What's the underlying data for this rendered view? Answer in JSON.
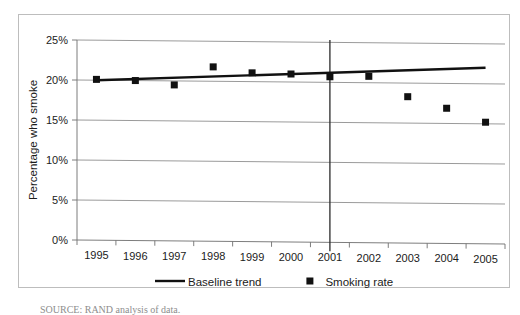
{
  "figure": {
    "source_note": "SOURCE: RAND analysis of data."
  },
  "chart_data": {
    "type": "scatter",
    "title": "",
    "subtitle": "",
    "xlabel": "",
    "ylabel": "Percentage who smoke",
    "categories": [
      "1995",
      "1996",
      "1997",
      "1998",
      "1999",
      "2000",
      "2001",
      "2002",
      "2003",
      "2004",
      "2005"
    ],
    "ylim": [
      0,
      25
    ],
    "ytick_labels": [
      "0%",
      "5%",
      "10%",
      "15%",
      "20%",
      "25%"
    ],
    "ytick_values": [
      0,
      5,
      10,
      15,
      20,
      25
    ],
    "grid": true,
    "legend_position": "bottom",
    "series": [
      {
        "name": "Smoking rate",
        "marker": "square",
        "color": "#111111",
        "values": [
          20.1,
          20.0,
          19.5,
          21.8,
          21.1,
          21.0,
          20.7,
          20.8,
          18.3,
          16.9,
          15.2
        ]
      },
      {
        "name": "Baseline trend",
        "marker": "line",
        "color": "#111111",
        "values": [
          20.0,
          20.2,
          20.4,
          20.6,
          20.9,
          21.1,
          21.3,
          21.5,
          21.7,
          21.9,
          22.0
        ]
      }
    ],
    "annotations": [
      {
        "name": "policy-reference-line",
        "type": "vertical-line",
        "x_category_position": 6.5,
        "label": ""
      }
    ],
    "legend": [
      {
        "label": "Baseline trend",
        "marker": "line"
      },
      {
        "label": "Smoking rate",
        "marker": "square"
      }
    ]
  }
}
